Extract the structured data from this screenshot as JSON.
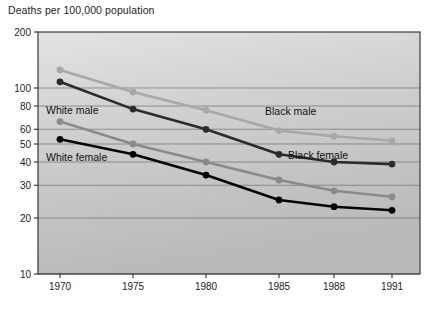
{
  "chart_data": {
    "type": "line",
    "title": "Deaths per 100,000 population",
    "xlabel": "",
    "ylabel": "",
    "yscale": "log",
    "ylim": [
      10,
      200
    ],
    "grid": true,
    "legend_position": "inline-annotations",
    "categories": [
      "1970",
      "1975",
      "1980",
      "1985",
      "1988",
      "1991"
    ],
    "x": [
      1970,
      1975,
      1980,
      1985,
      1988,
      1991
    ],
    "yticks": [
      200,
      100,
      80,
      60,
      50,
      40,
      30,
      20,
      10
    ],
    "yticklabels": [
      "200",
      "100",
      "80",
      "60",
      "50",
      "40",
      "30",
      "20",
      "10"
    ],
    "xticklabels": [
      "1970",
      "1975",
      "1980",
      "1985",
      "1988",
      "1991"
    ],
    "series": [
      {
        "name": "Black male",
        "color": "#a8a8a8",
        "values": [
          125,
          95,
          76,
          59,
          55,
          52
        ],
        "label_text": "Black male"
      },
      {
        "name": "White male",
        "color": "#2b2b2b",
        "values": [
          108,
          77,
          60,
          44,
          40,
          39
        ],
        "label_text": "White male"
      },
      {
        "name": "Black female",
        "color": "#8a8a8a",
        "values": [
          66,
          50,
          40,
          32,
          28,
          26
        ],
        "label_text": "Black female"
      },
      {
        "name": "White female",
        "color": "#050505",
        "values": [
          53,
          44,
          34,
          25,
          23,
          22
        ],
        "label_text": "White female"
      }
    ],
    "annotations": [
      {
        "text": "White male",
        "x_px": 46,
        "y_px": 114
      },
      {
        "text": "White female",
        "x_px": 46,
        "y_px": 161
      },
      {
        "text": "Black male",
        "x_px": 265,
        "y_px": 115
      },
      {
        "text": "Black female",
        "x_px": 288,
        "y_px": 159
      }
    ],
    "plot_background": "#c9c9c9",
    "figure_background": "#ffffff"
  }
}
